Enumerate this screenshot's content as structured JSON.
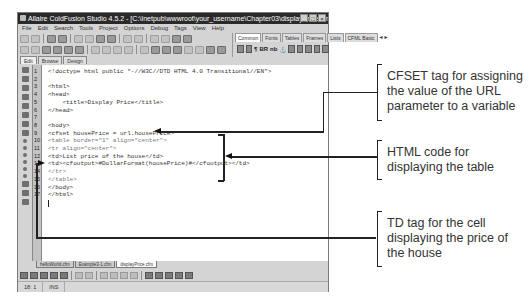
{
  "window": {
    "title": "Allaire ColdFusion Studio 4.5.2 - [C:\\Inetpub\\wwwroot\\your_username\\Chapter03\\displayPrice.cfm]",
    "controls": [
      "_",
      "□",
      "×"
    ]
  },
  "menubar": {
    "items": [
      "File",
      "Edit",
      "Search",
      "Tools",
      "Project",
      "Options",
      "Debug",
      "Tags",
      "View",
      "Help"
    ]
  },
  "tag_panel": {
    "tabs": [
      "Common",
      "Fonts",
      "Tables",
      "Frames",
      "Lists",
      "CFML Basic"
    ],
    "active_tab": "Common",
    "scroll_arrows": "◄►",
    "icons": [
      "quick-start-icon",
      "page-icon",
      "paragraph-icon",
      "line-break-icon",
      "nbsp-icon",
      "anchor-icon",
      "image-icon",
      "hr-icon",
      "align-left-icon",
      "align-center-icon",
      "table-icon"
    ],
    "icon_glyphs": {
      "paragraph": "¶",
      "line_break": "BR",
      "nbsp": "nb",
      "anchor": "⚓"
    }
  },
  "editor_tabs": {
    "items": [
      "Edit",
      "Browse",
      "Design"
    ],
    "active": "Edit"
  },
  "editor": {
    "lines": [
      {
        "n": "1",
        "text": "<!doctype html public \"-//W3C//DTD HTML 4.0 Transitional//EN\">",
        "dim": false
      },
      {
        "n": "2",
        "text": "",
        "dim": false
      },
      {
        "n": "3",
        "text": "<html>",
        "dim": false
      },
      {
        "n": "4",
        "text": "<head>",
        "dim": false
      },
      {
        "n": "5",
        "text": "    <title>Display Price</title>",
        "dim": false
      },
      {
        "n": "6",
        "text": "</head>",
        "dim": false
      },
      {
        "n": "7",
        "text": "",
        "dim": false
      },
      {
        "n": "8",
        "text": "<body>",
        "dim": false
      },
      {
        "n": "9",
        "text": "<cfset housePrice = url.housePrice>",
        "dim": false
      },
      {
        "n": "10",
        "text": "<table border=\"1\" align=\"center\">",
        "dim": true
      },
      {
        "n": "11",
        "text": "<tr align=\"center\">",
        "dim": true
      },
      {
        "n": "12",
        "text": "<td>List price of the house</td>",
        "dim": false
      },
      {
        "n": "13",
        "text": "<td><cfoutput>#DollarFormat(housePrice)#</cfoutput></td>",
        "dim": false
      },
      {
        "n": "14",
        "text": "</tr>",
        "dim": true
      },
      {
        "n": "15",
        "text": "</table>",
        "dim": true
      },
      {
        "n": "16",
        "text": "</body>",
        "dim": false
      },
      {
        "n": "17",
        "text": "</html>",
        "dim": false
      }
    ]
  },
  "file_tabs": {
    "items": [
      "helloWorld.cfm",
      "Example3-1.cfm",
      "displayPrice.cfm"
    ],
    "active": "displayPrice.cfm"
  },
  "statusbar": {
    "position": "18: 1",
    "mode": "INS"
  },
  "callouts": [
    {
      "id": "cfset",
      "text": "CFSET tag for assigning the value of the URL parameter to a variable"
    },
    {
      "id": "html-table",
      "text": "HTML code for displaying the table"
    },
    {
      "id": "td-price",
      "text": "TD tag for the cell displaying the price of the house"
    }
  ],
  "colors": {
    "titlebar": "#2a2a2a",
    "window_chrome": "#d4d4d4",
    "editor_bg": "#ffffff",
    "callout_text": "#333333",
    "leader_lines": "#222222"
  }
}
